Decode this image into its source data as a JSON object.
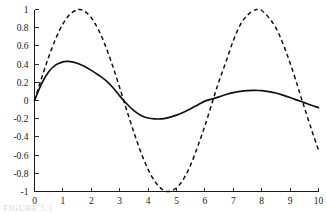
{
  "figure": {
    "caption": "FIGURE 5.1"
  },
  "chart_data": {
    "type": "line",
    "title": "",
    "xlabel": "",
    "ylabel": "",
    "xlim": [
      0,
      10
    ],
    "ylim": [
      -1,
      1
    ],
    "grid": false,
    "legend": "none",
    "xticks": [
      0,
      1,
      2,
      3,
      4,
      5,
      6,
      7,
      8,
      9,
      10
    ],
    "xtick_labels": [
      "0",
      "1",
      "2",
      "3",
      "4",
      "5",
      "6",
      "7",
      "8",
      "9",
      "10"
    ],
    "yticks": [
      1,
      0.8,
      0.6,
      0.4,
      0.2,
      0,
      -0.2,
      -0.4,
      -0.6,
      -0.8,
      -1
    ],
    "ytick_labels": [
      "1",
      "0.8",
      "0.6",
      "0.4",
      "0.2",
      "0",
      "-0.2",
      "-0.4",
      "-0.6",
      "-0.8",
      "-1"
    ],
    "axes_visible": [
      "left",
      "bottom"
    ],
    "series": [
      {
        "name": "dashed-curve",
        "style": "dashed",
        "color": "#111111",
        "x": [
          0,
          0.25,
          0.5,
          0.75,
          1,
          1.25,
          1.5,
          1.57,
          1.75,
          2,
          2.25,
          2.5,
          2.75,
          3,
          3.14,
          3.25,
          3.5,
          3.75,
          4,
          4.25,
          4.5,
          4.71,
          5,
          5.25,
          5.5,
          5.75,
          6,
          6.28,
          6.5,
          6.75,
          7,
          7.25,
          7.5,
          7.75,
          7.85,
          8,
          8.25,
          8.5,
          8.75,
          9,
          9.25,
          9.42,
          9.5,
          9.75,
          10
        ],
        "y": [
          0,
          0.247,
          0.479,
          0.682,
          0.841,
          0.949,
          0.997,
          1,
          0.984,
          0.909,
          0.778,
          0.599,
          0.382,
          0.141,
          0,
          -0.108,
          -0.351,
          -0.572,
          -0.757,
          -0.895,
          -0.978,
          -1,
          -0.959,
          -0.861,
          -0.706,
          -0.501,
          -0.279,
          0,
          0.215,
          0.434,
          0.657,
          0.835,
          0.938,
          0.994,
          0.999,
          0.989,
          0.911,
          0.798,
          0.623,
          0.412,
          0.173,
          0,
          -0.075,
          -0.315,
          -0.544
        ]
      },
      {
        "name": "solid-curve",
        "style": "solid",
        "color": "#111111",
        "x": [
          0,
          0.25,
          0.5,
          0.75,
          1,
          1.15,
          1.25,
          1.5,
          1.75,
          2,
          2.25,
          2.5,
          2.75,
          3,
          3.14,
          3.25,
          3.5,
          3.75,
          4,
          4.25,
          4.4,
          4.5,
          4.75,
          5,
          5.25,
          5.5,
          5.75,
          6,
          6.28,
          6.5,
          6.75,
          7,
          7.25,
          7.5,
          7.7,
          7.85,
          8,
          8.25,
          8.5,
          8.75,
          9,
          9.25,
          9.42,
          9.5,
          9.75,
          10
        ],
        "y": [
          0,
          0.185,
          0.315,
          0.391,
          0.424,
          0.43,
          0.428,
          0.41,
          0.376,
          0.331,
          0.28,
          0.224,
          0.146,
          0.051,
          0,
          -0.037,
          -0.112,
          -0.164,
          -0.192,
          -0.202,
          -0.203,
          -0.201,
          -0.186,
          -0.161,
          -0.128,
          -0.09,
          -0.049,
          -0.007,
          0.018,
          0.04,
          0.066,
          0.086,
          0.1,
          0.108,
          0.111,
          0.11,
          0.108,
          0.098,
          0.082,
          0.059,
          0.033,
          0.004,
          -0.014,
          -0.023,
          -0.052,
          -0.079
        ]
      }
    ],
    "annotations": {
      "dashed_peak_1": {
        "x": 1.57,
        "y": 1.0
      },
      "dashed_trough": {
        "x": 4.71,
        "y": -1.0
      },
      "dashed_peak_2": {
        "x": 7.85,
        "y": 1.0
      },
      "solid_peak_1": {
        "x": 1.15,
        "y": 0.43
      },
      "solid_trough": {
        "x": 4.4,
        "y": -0.2
      },
      "solid_peak_2": {
        "x": 7.7,
        "y": 0.11
      }
    }
  }
}
